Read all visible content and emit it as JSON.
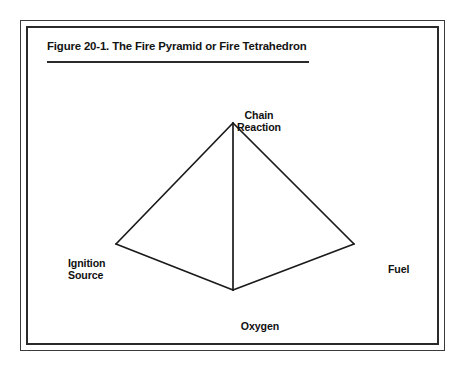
{
  "figure": {
    "caption": "Figure 20-1. The Fire Pyramid or Fire Tetrahedron",
    "frame_color": "#2a2a2a",
    "background_color": "#ffffff",
    "line_color": "#1a1a1a"
  },
  "diagram": {
    "type": "tetrahedron",
    "vertices": [
      {
        "id": "chain-reaction",
        "label": "Chain\nReaction",
        "x": 231,
        "y": 121,
        "label_position": "above"
      },
      {
        "id": "ignition-source",
        "label": "Ignition\nSource",
        "x": 114,
        "y": 242,
        "label_position": "left"
      },
      {
        "id": "fuel",
        "label": "Fuel",
        "x": 352,
        "y": 242,
        "label_position": "right"
      },
      {
        "id": "oxygen",
        "label": "Oxygen",
        "x": 231,
        "y": 288,
        "label_position": "below"
      }
    ],
    "edges": [
      {
        "from": "chain-reaction",
        "to": "ignition-source"
      },
      {
        "from": "chain-reaction",
        "to": "fuel"
      },
      {
        "from": "ignition-source",
        "to": "oxygen"
      },
      {
        "from": "fuel",
        "to": "oxygen"
      },
      {
        "from": "chain-reaction",
        "to": "oxygen"
      }
    ]
  }
}
